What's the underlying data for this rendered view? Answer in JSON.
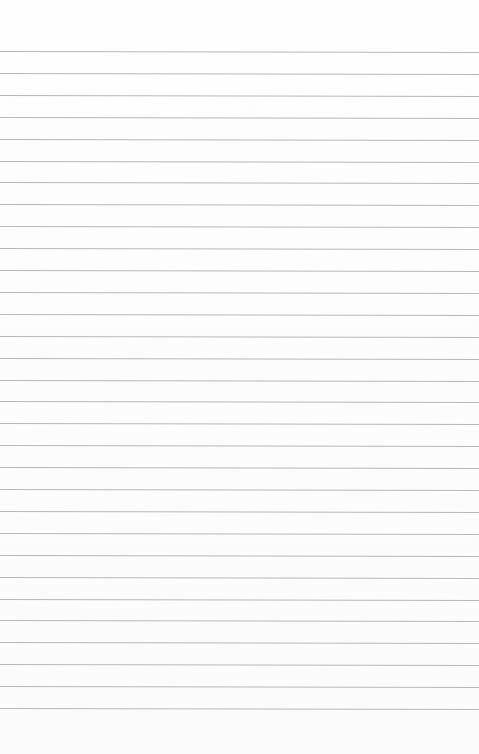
{
  "paper": {
    "type": "ruled-paper",
    "line_count": 31,
    "first_line_y": 51,
    "line_spacing": 21.9,
    "line_color": "#b8b8b8",
    "background_color": "#fdfdfd"
  }
}
